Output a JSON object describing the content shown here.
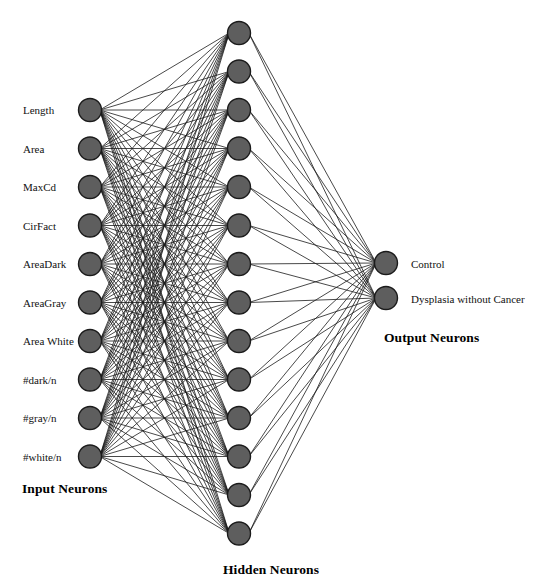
{
  "figure": {
    "kind": "neural-network-architecture-diagram",
    "background_color": "#ffffff",
    "node_fill_color": "#5e5e5e",
    "node_stroke_color": "#1b1b1b",
    "edge_color": "#1a1a1a",
    "width": 543,
    "height": 582
  },
  "layers": {
    "input": {
      "caption": "Input Neurons",
      "caption_x": 22,
      "caption_y": 481,
      "node_x": 90,
      "node_start_y": 110,
      "node_spacing": 38.5,
      "node_radius": 11.5,
      "label_x": 23,
      "label_offset_y": -6,
      "nodes": [
        {
          "label": "Length"
        },
        {
          "label": "Area"
        },
        {
          "label": "MaxCd"
        },
        {
          "label": "CirFact"
        },
        {
          "label": "AreaDark"
        },
        {
          "label": "AreaGray"
        },
        {
          "label": "Area White"
        },
        {
          "label": "#dark/n"
        },
        {
          "label": "#gray/n"
        },
        {
          "label": "#white/n"
        }
      ]
    },
    "hidden": {
      "caption": "Hidden Neurons",
      "caption_x": 223,
      "caption_y": 562,
      "node_x": 239,
      "node_start_y": 33,
      "node_spacing": 38.5,
      "node_radius": 11.5,
      "count": 14
    },
    "output": {
      "caption": "Output Neurons",
      "caption_x": 384,
      "caption_y": 330,
      "node_x": 386,
      "node_start_y": 263,
      "node_spacing": 35,
      "node_radius": 11.5,
      "label_x": 411,
      "label_offset_y": -5,
      "nodes": [
        {
          "label": "Control"
        },
        {
          "label": "Dysplasia without Cancer"
        }
      ]
    }
  },
  "chart_data": {
    "type": "diagram",
    "title": "",
    "architecture": "fully-connected feedforward neural network",
    "layer_sizes": [
      10,
      14,
      2
    ],
    "input_labels": [
      "Length",
      "Area",
      "MaxCd",
      "CirFact",
      "AreaDark",
      "AreaGray",
      "Area White",
      "#dark/n",
      "#gray/n",
      "#white/n"
    ],
    "hidden_labels": [],
    "output_labels": [
      "Control",
      "Dysplasia without Cancer"
    ],
    "captions": [
      "Input Neurons",
      "Hidden Neurons",
      "Output Neurons"
    ],
    "edges": {
      "input_to_hidden": 140,
      "hidden_to_output": 28,
      "total": 168,
      "fully_connected": true
    }
  }
}
